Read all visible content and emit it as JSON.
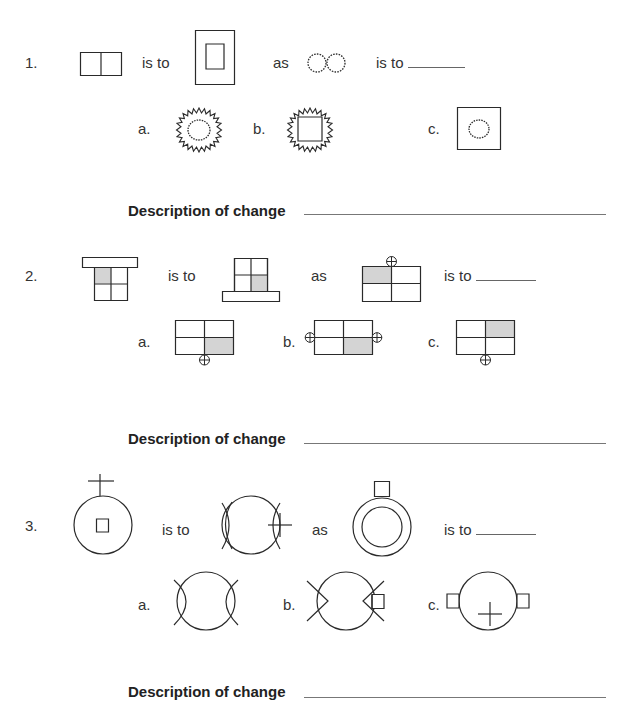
{
  "worksheet": {
    "problems": [
      {
        "number": "1.",
        "connector_is_to": "is to",
        "connector_as": "as",
        "connector_is_to_2": "is to",
        "figure_a": "two squares side by side",
        "figure_b": "small rectangle inside large rectangle",
        "figure_c": "two jagged circles side by side",
        "options": [
          {
            "label": "a.",
            "figure": "jagged circle inside jagged circle"
          },
          {
            "label": "b.",
            "figure": "square inside jagged circle"
          },
          {
            "label": "c.",
            "figure": "jagged circle inside square"
          }
        ],
        "description_label": "Description of change"
      },
      {
        "number": "2.",
        "connector_is_to": "is to",
        "connector_as": "as",
        "connector_is_to_2": "is to",
        "figure_a": "2x2 grid with top-left shaded, bar on top",
        "figure_b": "2x2 grid with bottom-right shaded, bar on bottom",
        "figure_c": "2x2 wide grid with top-left shaded, circled cross on top",
        "options": [
          {
            "label": "a.",
            "figure": "bottom-right shaded, circled cross on bottom"
          },
          {
            "label": "b.",
            "figure": "bottom-right shaded, circled crosses on left and right"
          },
          {
            "label": "c.",
            "figure": "top-right shaded, circled cross on bottom"
          }
        ],
        "description_label": "Description of change"
      },
      {
        "number": "3.",
        "connector_is_to": "is to",
        "connector_as": "as",
        "connector_is_to_2": "is to",
        "figure_a": "circle with square inside, cross on top",
        "figure_b": "circle with arcs on both sides, cross on right",
        "figure_c": "double circle with square on top",
        "options": [
          {
            "label": "a.",
            "figure": "circle with arcs on both sides"
          },
          {
            "label": "b.",
            "figure": "circle with V notches on sides, square on right"
          },
          {
            "label": "c.",
            "figure": "circle with cross inside, squares on both sides"
          }
        ],
        "description_label": "Description of change"
      }
    ],
    "colors": {
      "stroke": "#2a2a2a",
      "shade": "#d4d4d4",
      "line": "#777777"
    }
  }
}
